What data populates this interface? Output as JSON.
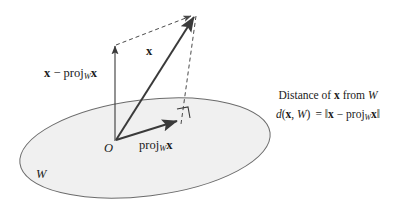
{
  "figure": {
    "width": 409,
    "height": 209
  },
  "colors": {
    "background": "#ffffff",
    "plane_fill": "#f0f0f0",
    "plane_stroke": "#6b6b6b",
    "vector_stroke": "#3a3a3a",
    "dashed_stroke": "#4a4a4a",
    "text": "#1a1a1a"
  },
  "labels": {
    "difference_vector": {
      "x_symbol": "x",
      "minus": "−",
      "proj": "proj",
      "subscript": "W",
      "x_symbol_2": "x"
    },
    "x_vector": "x",
    "origin": "O",
    "projection": {
      "proj": "proj",
      "subscript": "W",
      "x_symbol": "x"
    },
    "plane": "W"
  },
  "caption": {
    "line1": {
      "prefix": "Distance of",
      "x_symbol": "x",
      "middle": "from",
      "subspace": "W"
    },
    "line2": {
      "d": "d",
      "open": "(",
      "x_symbol": "x",
      "comma": ",",
      "subspace": "W",
      "close": ")",
      "equals": "=",
      "norm_open": "‖",
      "x_symbol_2": "x",
      "minus": "−",
      "proj": "proj",
      "subscript": "W",
      "x_symbol_3": "x",
      "norm_close": "‖"
    }
  },
  "geometry": {
    "origin": {
      "x": 116,
      "y": 140
    },
    "x_tip": {
      "x": 196,
      "y": 14
    },
    "proj_tip": {
      "x": 180,
      "y": 120
    },
    "diff_arrow_top": {
      "x": 115,
      "y": 45
    },
    "diff_arrow_base": {
      "x": 115,
      "y": 141
    },
    "plane_center": {
      "x": 145,
      "y": 148
    },
    "plane_rx": 126,
    "plane_ry": 48,
    "plane_rotation_deg": -7
  }
}
